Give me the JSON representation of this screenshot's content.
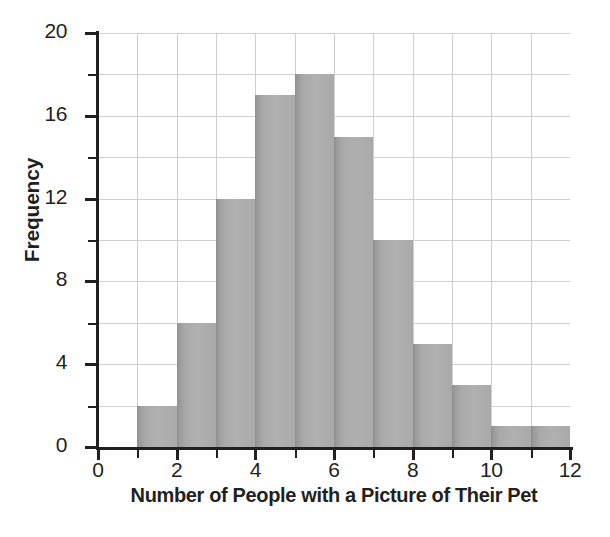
{
  "chart_data": {
    "type": "bar",
    "title": "",
    "subtitle": "",
    "xlabel": "Number of People with a Picture of Their Pet",
    "ylabel": "Frequency",
    "xlim": [
      0,
      12
    ],
    "ylim": [
      0,
      20
    ],
    "grid": true,
    "legend": null,
    "bin_width": 1,
    "bin_starts": [
      1,
      2,
      3,
      4,
      5,
      6,
      7,
      8,
      9,
      10,
      11
    ],
    "bin_ends": [
      2,
      3,
      4,
      5,
      6,
      7,
      8,
      9,
      10,
      11,
      12
    ],
    "categories": [
      "1-2",
      "2-3",
      "3-4",
      "4-5",
      "5-6",
      "6-7",
      "7-8",
      "8-9",
      "9-10",
      "10-11",
      "11-12"
    ],
    "values": [
      2,
      6,
      12,
      17,
      18,
      15,
      10,
      5,
      3,
      1,
      1
    ],
    "x_ticks_major": [
      0,
      2,
      4,
      6,
      8,
      10,
      12
    ],
    "x_tick_labels": [
      "0",
      "2",
      "4",
      "6",
      "8",
      "10",
      "12"
    ],
    "x_ticks_minor": [
      1,
      3,
      5,
      7,
      9,
      11
    ],
    "y_ticks_major": [
      0,
      4,
      8,
      12,
      16,
      20
    ],
    "y_tick_labels": [
      "0",
      "4",
      "8",
      "12",
      "16",
      "20"
    ],
    "y_ticks_minor": [
      2,
      6,
      10,
      14,
      18
    ],
    "x_gridlines": [
      1,
      2,
      3,
      4,
      5,
      6,
      7,
      8,
      9,
      10,
      11
    ],
    "y_gridlines": [
      2,
      4,
      6,
      8,
      10,
      12,
      14,
      16,
      18,
      20
    ],
    "colors": {
      "bar_fill": "#aaaaaa",
      "bar_edge": "#8f8f8f",
      "grid": "#cfcfcf",
      "axis": "#231f20",
      "text": "#231f20",
      "background": "#ffffff"
    }
  }
}
